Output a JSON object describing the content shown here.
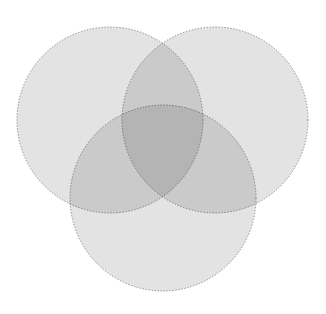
{
  "figure": {
    "kind": "venn-diagram",
    "title": "",
    "width": 326,
    "height": 314,
    "background_color": "#ffffff"
  },
  "style": {
    "fill_color": "#e3e3e3",
    "fill_opacity": "1",
    "stroke_color": "#8c8c8c",
    "stroke_width": "1",
    "stroke_dasharray": "1.4 1.6",
    "blend_mode": "multiply",
    "single_region_color": "#e4e4e4",
    "double_region_color": "#c3c3c3",
    "triple_region_color": "#909090"
  },
  "sets": [
    {
      "id": "set-a",
      "name": "left-set",
      "label": "",
      "cx": 110,
      "cy": 120,
      "r": 93,
      "fill": "#e3e3e3",
      "stroke": "#8c8c8c"
    },
    {
      "id": "set-b",
      "name": "right-set",
      "label": "",
      "cx": 215,
      "cy": 120,
      "r": 93,
      "fill": "#e3e3e3",
      "stroke": "#8c8c8c"
    },
    {
      "id": "set-c",
      "name": "bottom-set",
      "label": "",
      "cx": 163,
      "cy": 198,
      "r": 93,
      "fill": "#e3e3e3",
      "stroke": "#8c8c8c"
    }
  ],
  "regions": [
    {
      "id": "region-a-only",
      "name": "left-only-region",
      "label": "",
      "cx": 68,
      "cy": 86
    },
    {
      "id": "region-b-only",
      "name": "right-only-region",
      "label": "",
      "cx": 258,
      "cy": 86
    },
    {
      "id": "region-c-only",
      "name": "bottom-only-region",
      "label": "",
      "cx": 163,
      "cy": 258
    },
    {
      "id": "region-ab",
      "name": "left-right-overlap-region",
      "label": "",
      "cx": 163,
      "cy": 80
    },
    {
      "id": "region-ac",
      "name": "left-bottom-overlap-region",
      "label": "",
      "cx": 104,
      "cy": 186
    },
    {
      "id": "region-bc",
      "name": "right-bottom-overlap-region",
      "label": "",
      "cx": 222,
      "cy": 186
    },
    {
      "id": "region-abc",
      "name": "center-triple-overlap-region",
      "label": "",
      "cx": 163,
      "cy": 155
    }
  ],
  "chart_data": {
    "type": "venn",
    "title": "",
    "xlabel": "",
    "ylabel": "",
    "set_count": 3,
    "set_labels": [
      "",
      "",
      ""
    ],
    "region_labels": [
      "",
      "",
      "",
      "",
      "",
      "",
      ""
    ],
    "legend": [],
    "grid": false
  }
}
